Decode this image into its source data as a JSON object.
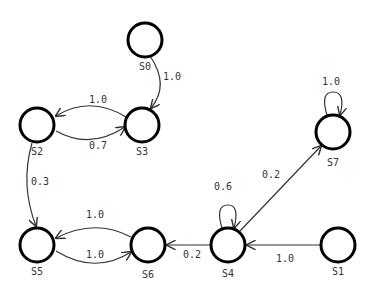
{
  "diagram": {
    "type": "state-transition-graph",
    "nodes": [
      {
        "id": "S0",
        "label": "S0",
        "x": 145,
        "y": 40
      },
      {
        "id": "S1",
        "label": "S1",
        "x": 338,
        "y": 245
      },
      {
        "id": "S2",
        "label": "S2",
        "x": 37,
        "y": 125
      },
      {
        "id": "S3",
        "label": "S3",
        "x": 142,
        "y": 125
      },
      {
        "id": "S4",
        "label": "S4",
        "x": 228,
        "y": 245
      },
      {
        "id": "S5",
        "label": "S5",
        "x": 37,
        "y": 245
      },
      {
        "id": "S6",
        "label": "S6",
        "x": 148,
        "y": 245
      },
      {
        "id": "S7",
        "label": "S7",
        "x": 333,
        "y": 132
      }
    ],
    "edges": [
      {
        "from": "S0",
        "to": "S3",
        "label": "1.0"
      },
      {
        "from": "S3",
        "to": "S2",
        "label": "1.0"
      },
      {
        "from": "S2",
        "to": "S3",
        "label": "0.7"
      },
      {
        "from": "S2",
        "to": "S5",
        "label": "0.3"
      },
      {
        "from": "S6",
        "to": "S5",
        "label": "1.0"
      },
      {
        "from": "S5",
        "to": "S6",
        "label": "1.0"
      },
      {
        "from": "S4",
        "to": "S6",
        "label": "0.2"
      },
      {
        "from": "S4",
        "to": "S4",
        "label": "0.6"
      },
      {
        "from": "S4",
        "to": "S7",
        "label": "0.2"
      },
      {
        "from": "S1",
        "to": "S4",
        "label": "1.0"
      },
      {
        "from": "S7",
        "to": "S7",
        "label": "1.0"
      }
    ]
  }
}
